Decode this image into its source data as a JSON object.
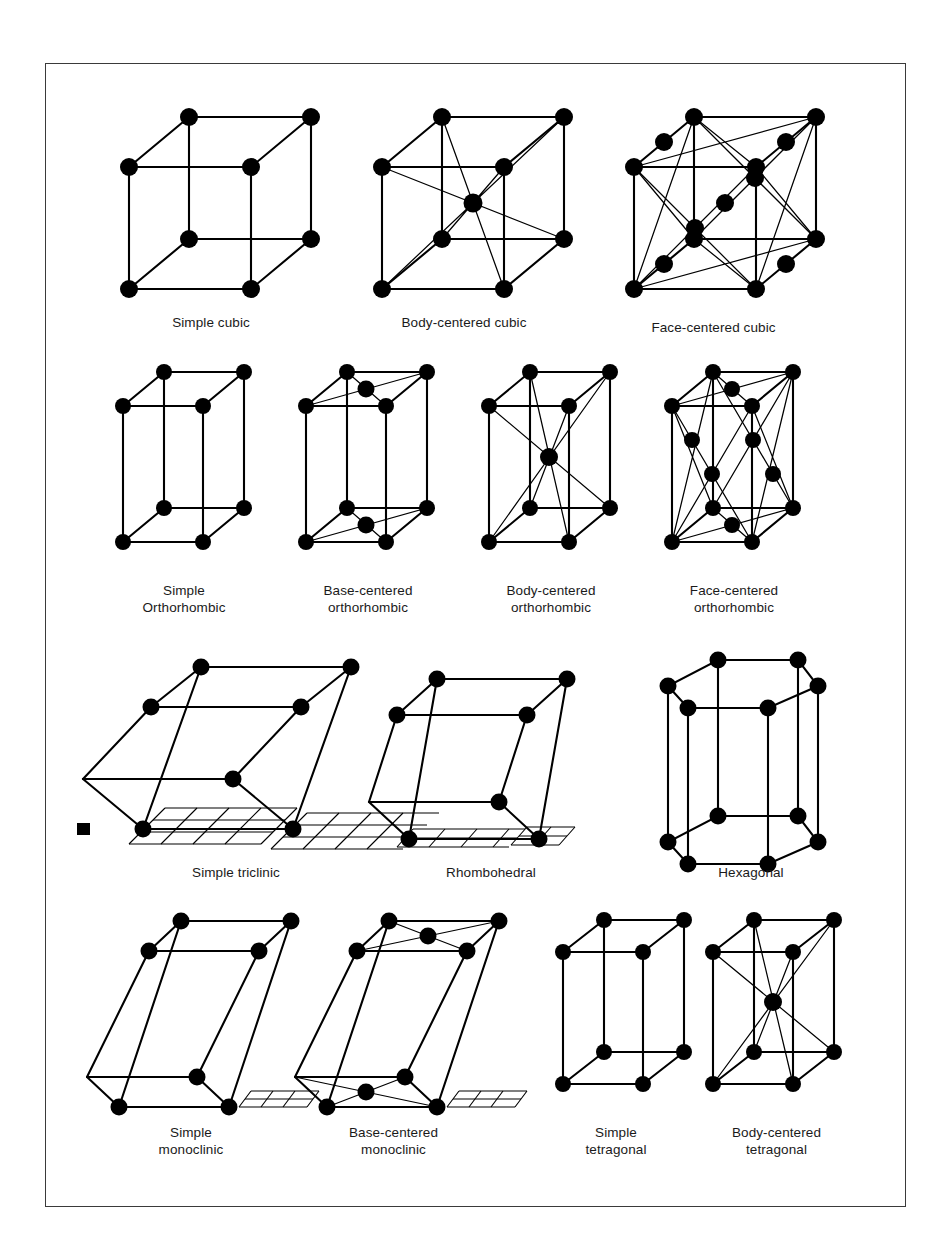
{
  "figure": {
    "kind": "bravais-lattice-chart",
    "background": "#ffffff",
    "ink": "#000000",
    "frame_color": "#3a3a3a"
  },
  "rows": [
    {
      "row_index": 1,
      "cells": [
        {
          "id": "simple-cubic",
          "label": "Simple cubic",
          "shape": "cube",
          "centers": "none"
        },
        {
          "id": "body-centered-cubic",
          "label": "Body-centered cubic",
          "shape": "cube",
          "centers": "body"
        },
        {
          "id": "face-centered-cubic",
          "label": "Face-centered cubic",
          "shape": "cube",
          "centers": "face"
        }
      ]
    },
    {
      "row_index": 2,
      "cells": [
        {
          "id": "simple-orthorhombic",
          "label": "Simple\nOrthorhombic",
          "shape": "prism",
          "centers": "none"
        },
        {
          "id": "base-centered-orthorhombic",
          "label": "Base-centered\northorhombic",
          "shape": "prism",
          "centers": "base"
        },
        {
          "id": "body-centered-orthorhombic",
          "label": "Body-centered\northorhombic",
          "shape": "prism",
          "centers": "body"
        },
        {
          "id": "face-centered-orthorhombic",
          "label": "Face-centered\northorhombic",
          "shape": "prism",
          "centers": "face"
        }
      ]
    },
    {
      "row_index": 3,
      "cells": [
        {
          "id": "simple-triclinic",
          "label": "Simple triclinic",
          "shape": "triclinic",
          "centers": "none",
          "ground_plane": true
        },
        {
          "id": "rhombohedral",
          "label": "Rhombohedral",
          "shape": "rhombohedral",
          "centers": "none",
          "ground_plane": true
        },
        {
          "id": "hexagonal",
          "label": "Hexagonal",
          "shape": "hexagonal",
          "centers": "none",
          "ground_plane": false
        }
      ]
    },
    {
      "row_index": 4,
      "cells": [
        {
          "id": "simple-monoclinic",
          "label": "Simple\nmonoclinic",
          "shape": "monoclinic",
          "centers": "none",
          "ground_plane": true
        },
        {
          "id": "base-centered-monoclinic",
          "label": "Base-centered\nmonoclinic",
          "shape": "monoclinic",
          "centers": "base",
          "ground_plane": true
        },
        {
          "id": "simple-tetragonal",
          "label": "Simple\ntetragonal",
          "shape": "prism",
          "centers": "none"
        },
        {
          "id": "body-centered-tetragonal",
          "label": "Body-centered\ntetragonal",
          "shape": "prism",
          "centers": "body"
        }
      ]
    }
  ]
}
